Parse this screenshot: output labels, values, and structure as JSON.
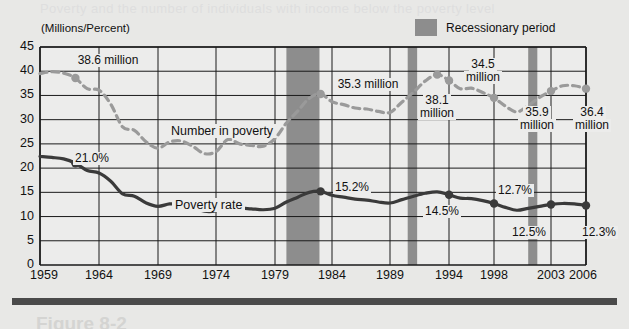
{
  "page": {
    "ghost_top": "Poverty and the number of individuals with income below the poverty level",
    "ghost_bottom": "Figure 8-2"
  },
  "axis_unit_label": "(Millions/Percent)",
  "legend": {
    "swatch_name": "recession-swatch",
    "label": "Recessionary period"
  },
  "series_labels": {
    "number_in_poverty": "Number in poverty",
    "poverty_rate": "Poverty rate"
  },
  "annotations": [
    {
      "id": "a1",
      "text": "38.6 million",
      "lines": [
        "38.6 million"
      ]
    },
    {
      "id": "a2",
      "text": "21.0%",
      "lines": [
        "21.0%"
      ]
    },
    {
      "id": "a3",
      "text": "35.3 million",
      "lines": [
        "35.3 million"
      ]
    },
    {
      "id": "a4",
      "text": "15.2%",
      "lines": [
        "15.2%"
      ]
    },
    {
      "id": "a5",
      "text": "38.1 million",
      "lines": [
        "38.1",
        "million"
      ]
    },
    {
      "id": "a6",
      "text": "34.5 million",
      "lines": [
        "34.5",
        "million"
      ]
    },
    {
      "id": "a7",
      "text": "14.5%",
      "lines": [
        "14.5%"
      ]
    },
    {
      "id": "a8",
      "text": "12.7%",
      "lines": [
        "12.7%"
      ]
    },
    {
      "id": "a9",
      "text": "35.9 million",
      "lines": [
        "35.9",
        "million"
      ]
    },
    {
      "id": "a10",
      "text": "12.5%",
      "lines": [
        "12.5%"
      ]
    },
    {
      "id": "a11",
      "text": "36.4 million",
      "lines": [
        "36.4",
        "million"
      ]
    },
    {
      "id": "a12",
      "text": "12.3%",
      "lines": [
        "12.3%"
      ]
    }
  ],
  "colors": {
    "plot_background": "#ececeb",
    "page_background": "#e8e8e6",
    "grid": "#1a1a1a",
    "poverty_rate_line": "#3a3a3a",
    "number_in_poverty_line": "#9a9a9a",
    "recession_band": "#8d8d8d",
    "text": "#111111"
  },
  "chart_data": {
    "type": "line",
    "title": "",
    "subtitle": "",
    "xlabel": "",
    "ylabel": "(Millions/Percent)",
    "ylim": [
      0,
      45
    ],
    "xlim": [
      1959,
      2006
    ],
    "grid": true,
    "legend_position": "top-right",
    "y_ticks": [
      0,
      5,
      10,
      15,
      20,
      25,
      30,
      35,
      40,
      45
    ],
    "x_ticks": [
      1959,
      1964,
      1969,
      1974,
      1979,
      1984,
      1989,
      1994,
      1998,
      2003,
      2006
    ],
    "recession_periods": [
      {
        "start": 1980.0,
        "end": 1982.9
      },
      {
        "start": 1990.5,
        "end": 1991.3
      },
      {
        "start": 2001.0,
        "end": 2001.8
      }
    ],
    "series": [
      {
        "name": "Number in poverty",
        "unit": "millions",
        "style": "dashed",
        "color": "#9a9a9a",
        "x": [
          1959,
          1960,
          1961,
          1962,
          1963,
          1964,
          1965,
          1966,
          1967,
          1968,
          1969,
          1970,
          1971,
          1972,
          1973,
          1974,
          1975,
          1976,
          1977,
          1978,
          1979,
          1980,
          1981,
          1982,
          1983,
          1984,
          1985,
          1986,
          1987,
          1988,
          1989,
          1990,
          1991,
          1992,
          1993,
          1994,
          1995,
          1996,
          1997,
          1998,
          1999,
          2000,
          2001,
          2002,
          2003,
          2004,
          2005,
          2006
        ],
        "values": [
          39.5,
          39.9,
          39.6,
          38.6,
          36.4,
          36.1,
          33.2,
          28.5,
          27.8,
          25.4,
          24.1,
          25.4,
          25.6,
          24.5,
          23.0,
          23.4,
          25.9,
          25.0,
          24.7,
          24.5,
          26.1,
          29.3,
          31.8,
          34.4,
          35.3,
          33.7,
          33.1,
          32.4,
          32.2,
          31.7,
          31.5,
          33.6,
          35.7,
          38.0,
          39.3,
          38.1,
          36.4,
          36.5,
          35.6,
          34.5,
          32.8,
          31.6,
          32.9,
          34.6,
          35.9,
          37.0,
          37.0,
          36.4
        ],
        "highlighted_points": [
          {
            "x": 1962,
            "y": 38.6,
            "label": "38.6 million"
          },
          {
            "x": 1983,
            "y": 35.3,
            "label": "35.3 million"
          },
          {
            "x": 1994,
            "y": 38.1,
            "label": "38.1 million"
          },
          {
            "x": 1993,
            "y": 39.3,
            "label": ""
          },
          {
            "x": 1998,
            "y": 34.5,
            "label": "34.5 million"
          },
          {
            "x": 2003,
            "y": 35.9,
            "label": "35.9 million"
          },
          {
            "x": 2006,
            "y": 36.4,
            "label": "36.4 million"
          }
        ]
      },
      {
        "name": "Poverty rate",
        "unit": "percent",
        "style": "solid",
        "color": "#3a3a3a",
        "x": [
          1959,
          1960,
          1961,
          1962,
          1963,
          1964,
          1965,
          1966,
          1967,
          1968,
          1969,
          1970,
          1971,
          1972,
          1973,
          1974,
          1975,
          1976,
          1977,
          1978,
          1979,
          1980,
          1981,
          1982,
          1983,
          1984,
          1985,
          1986,
          1987,
          1988,
          1989,
          1990,
          1991,
          1992,
          1993,
          1994,
          1995,
          1996,
          1997,
          1998,
          1999,
          2000,
          2001,
          2002,
          2003,
          2004,
          2005,
          2006
        ],
        "values": [
          22.4,
          22.2,
          21.9,
          21.0,
          19.5,
          19.0,
          17.3,
          14.7,
          14.2,
          12.8,
          12.1,
          12.6,
          12.5,
          11.9,
          11.1,
          11.2,
          12.3,
          11.8,
          11.6,
          11.4,
          11.7,
          13.0,
          14.0,
          15.0,
          15.2,
          14.4,
          14.0,
          13.6,
          13.4,
          13.0,
          12.8,
          13.5,
          14.2,
          14.8,
          15.1,
          14.5,
          13.8,
          13.7,
          13.3,
          12.7,
          11.9,
          11.3,
          11.7,
          12.1,
          12.5,
          12.7,
          12.6,
          12.3
        ],
        "highlighted_points": [
          {
            "x": 1962,
            "y": 21.0,
            "label": "21.0%"
          },
          {
            "x": 1983,
            "y": 15.2,
            "label": "15.2%"
          },
          {
            "x": 1994,
            "y": 14.5,
            "label": "14.5%"
          },
          {
            "x": 1998,
            "y": 12.7,
            "label": "12.7%"
          },
          {
            "x": 2003,
            "y": 12.5,
            "label": "12.5%"
          },
          {
            "x": 2006,
            "y": 12.3,
            "label": "12.3%"
          }
        ]
      }
    ]
  }
}
